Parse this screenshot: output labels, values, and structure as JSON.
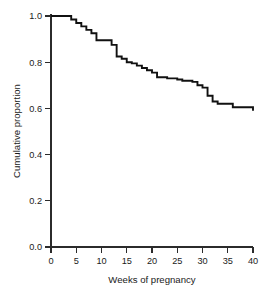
{
  "chart_data": {
    "type": "line",
    "subtype": "step-kaplan-meier",
    "title": "",
    "xlabel": "Weeks of pregnancy",
    "ylabel": "Cumulative proportion",
    "xlim": [
      0,
      40
    ],
    "ylim": [
      0.0,
      1.0
    ],
    "xticks": [
      0,
      5,
      10,
      15,
      20,
      25,
      30,
      35,
      40
    ],
    "xtick_labels": [
      "0",
      "5",
      "10",
      "15",
      "20",
      "25",
      "30",
      "35",
      "40"
    ],
    "yticks": [
      0.0,
      0.2,
      0.4,
      0.6,
      0.8,
      1.0
    ],
    "ytick_labels": [
      "0.0",
      "0.2",
      "0.4",
      "0.6",
      "0.8",
      "1.0"
    ],
    "grid": false,
    "legend": null,
    "legend_position": "none",
    "line_color": "#111111",
    "axis_color": "#2b2b2b",
    "background_color": "#ffffff",
    "step_mode": "post",
    "x": [
      0,
      3,
      4,
      5,
      6,
      7,
      8,
      9,
      11,
      12,
      13,
      14,
      15,
      16,
      17,
      18,
      19,
      20,
      21,
      23,
      25,
      26,
      27,
      28,
      29,
      30,
      31,
      32,
      33,
      36,
      40
    ],
    "values": [
      1.0,
      1.0,
      0.985,
      0.97,
      0.955,
      0.94,
      0.925,
      0.895,
      0.895,
      0.875,
      0.825,
      0.815,
      0.8,
      0.795,
      0.785,
      0.775,
      0.765,
      0.755,
      0.735,
      0.73,
      0.725,
      0.72,
      0.72,
      0.715,
      0.7,
      0.69,
      0.655,
      0.63,
      0.62,
      0.605,
      0.59
    ],
    "series": [
      {
        "name": "Cumulative proportion remaining pregnant",
        "x": [
          0,
          3,
          4,
          5,
          6,
          7,
          8,
          9,
          11,
          12,
          13,
          14,
          15,
          16,
          17,
          18,
          19,
          20,
          21,
          23,
          25,
          26,
          27,
          28,
          29,
          30,
          31,
          32,
          33,
          36,
          40
        ],
        "values": [
          1.0,
          1.0,
          0.985,
          0.97,
          0.955,
          0.94,
          0.925,
          0.895,
          0.895,
          0.875,
          0.825,
          0.815,
          0.8,
          0.795,
          0.785,
          0.775,
          0.765,
          0.755,
          0.735,
          0.73,
          0.725,
          0.72,
          0.72,
          0.715,
          0.7,
          0.69,
          0.655,
          0.63,
          0.62,
          0.605,
          0.59
        ]
      }
    ],
    "start_value": 1.0,
    "end_value": 0.59,
    "annotations": []
  }
}
